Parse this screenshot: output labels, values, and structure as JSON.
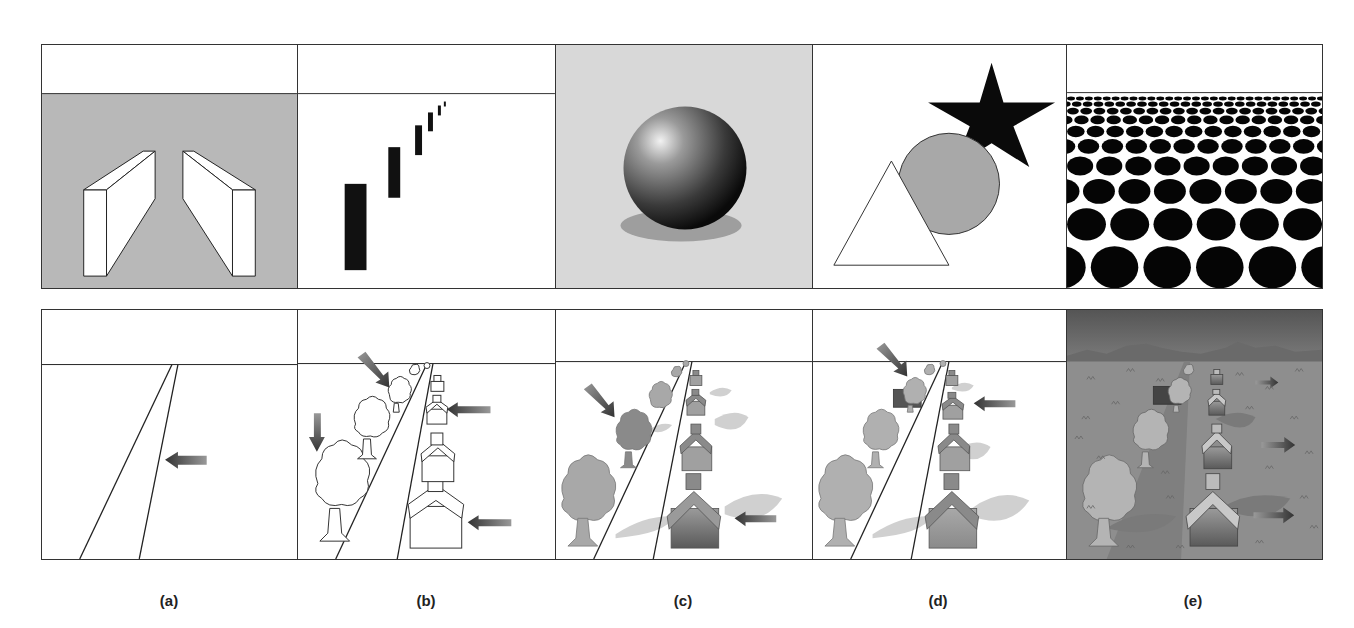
{
  "figure": {
    "colors": {
      "panel_gray": "#b8b8b8",
      "light_gray_bg": "#d8d8d8",
      "line": "#222222",
      "arrow": "#555555",
      "tree_fill": "#a8a8a8",
      "house_fill": "#8a8a8a",
      "field_e": "#8e8e8e",
      "sky_e": "#5a5a5a"
    },
    "columns": [
      {
        "id": "a",
        "label": "(a)",
        "top": "occlusion-free boxes converging (linear perspective)",
        "bottom": "road converging to horizon"
      },
      {
        "id": "b",
        "label": "(b)",
        "top": "rectangles diminishing in size (relative size)",
        "bottom": "line-drawing scene with trees and houses"
      },
      {
        "id": "c",
        "label": "(c)",
        "top": "shaded sphere with cast shadow (shading)",
        "bottom": "shaded scene with shadows"
      },
      {
        "id": "d",
        "label": "(d)",
        "top": "overlapping triangle, circle, star (occlusion)",
        "bottom": "scene with occlusion"
      },
      {
        "id": "e",
        "label": "(e)",
        "top": "texture gradient of ellipses",
        "bottom": "full scene with textured field and mountains"
      }
    ]
  }
}
